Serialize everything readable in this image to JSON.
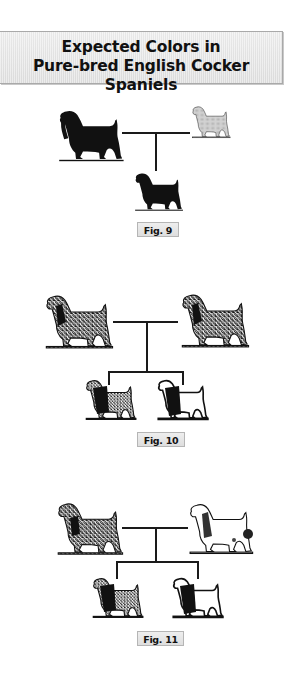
{
  "title": {
    "line1": "Expected Colors in",
    "line2": "Pure-bred English Cocker Spaniels"
  },
  "figures": [
    {
      "label": "Fig. 9",
      "parents": [
        {
          "color": "solid-black",
          "fill": "#111111"
        },
        {
          "color": "golden-light",
          "fill": "#c8c8c8"
        }
      ],
      "offspring": [
        {
          "color": "solid-black",
          "fill": "#111111"
        }
      ]
    },
    {
      "label": "Fig. 10",
      "parents": [
        {
          "color": "blue-roan",
          "fill": "roan"
        },
        {
          "color": "blue-roan",
          "fill": "roan"
        }
      ],
      "offspring": [
        {
          "color": "blue-roan",
          "fill": "roan"
        },
        {
          "color": "black-and-white",
          "fill": "parti"
        }
      ]
    },
    {
      "label": "Fig. 11",
      "parents": [
        {
          "color": "blue-roan",
          "fill": "roan"
        },
        {
          "color": "black-and-white-ticked",
          "fill": "parti"
        }
      ],
      "offspring": [
        {
          "color": "blue-roan",
          "fill": "roan"
        },
        {
          "color": "black-and-white",
          "fill": "parti"
        }
      ]
    }
  ],
  "colors": {
    "line": "#1a1a1a",
    "label_bg": "#e6e6e6",
    "title_bg": "#e8e8e8"
  }
}
